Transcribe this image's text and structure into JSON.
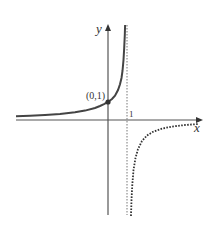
{
  "figure": {
    "type": "function-graph",
    "function": "y = 1/(1-x)",
    "x_axis_label": "x",
    "y_axis_label": "y",
    "point_label": "(0,1)",
    "asymptote_label": "1",
    "colors": {
      "axis": "#555555",
      "curve_left": "#444444",
      "curve_right": "#333333",
      "asymptote": "#777777",
      "point": "#333333"
    },
    "curves": [
      {
        "name": "left-branch",
        "domain": "x < 1",
        "style": "solid"
      },
      {
        "name": "right-branch",
        "domain": "x > 1",
        "style": "dotted"
      }
    ],
    "asymptotes": [
      {
        "type": "vertical",
        "x": 1,
        "style": "dotted"
      },
      {
        "type": "horizontal",
        "y": 0
      }
    ],
    "marked_points": [
      {
        "x": 0,
        "y": 1,
        "label": "(0,1)"
      }
    ]
  }
}
